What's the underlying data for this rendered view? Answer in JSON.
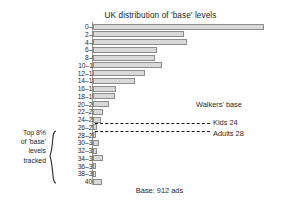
{
  "chart_data": {
    "type": "bar",
    "orientation": "horizontal",
    "title": "UK distribution of 'base' levels",
    "xlabel": "",
    "ylabel": "",
    "grid": false,
    "legend_position": "none",
    "categories": [
      "0–1",
      "2–3",
      "4–5",
      "6–7",
      "8–9",
      "10–11",
      "12–13",
      "14–15",
      "16–17",
      "18–19",
      "20–21",
      "22–23",
      "24–25",
      "26–27",
      "28–29",
      "30–31",
      "32–33",
      "34–35",
      "36–37",
      "38–39",
      "40+"
    ],
    "values": [
      180,
      95,
      99,
      67,
      65,
      72,
      55,
      44,
      24,
      23,
      17,
      10,
      8,
      4,
      3,
      6,
      4,
      11,
      3,
      1,
      9
    ],
    "xlim": [
      0,
      190
    ],
    "bar_fill": "#d9d9d9",
    "bar_stroke": "#8d8d8d",
    "annotations": {
      "walkers_base": "Walkers' base",
      "kids": "Kids 24",
      "adults": "Adults 28",
      "left_caption": [
        "Top 8%",
        "of 'base'",
        "levels",
        "tracked"
      ],
      "footer": "Base: 912 ads"
    }
  }
}
